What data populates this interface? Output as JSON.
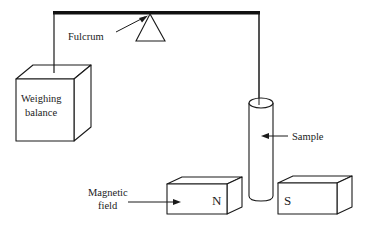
{
  "diagram": {
    "labels": {
      "fulcrum": "Fulcrum",
      "balance_line1": "Weighing",
      "balance_line2": "balance",
      "sample": "Sample",
      "field_line1": "Magnetic",
      "field_line2": "field",
      "north": "N",
      "south": "S"
    },
    "colors": {
      "stroke": "#1a1a1a",
      "text": "#222222",
      "background": "#ffffff"
    }
  }
}
